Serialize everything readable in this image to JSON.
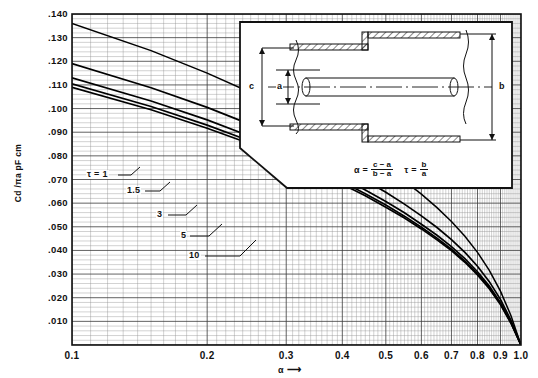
{
  "chart_data": {
    "type": "line",
    "title": "",
    "xlabel": "α",
    "ylabel": "Cd /πa pF cm",
    "xscale": "log",
    "yscale": "linear",
    "xlim": [
      0.1,
      1.0
    ],
    "ylim": [
      0.0,
      0.14
    ],
    "grid": true,
    "legend_position": "inline-labels",
    "xticks": [
      "0.1",
      "0.2",
      "0.3",
      "0.4",
      "0.5",
      "0.6",
      "0.7",
      "0.8",
      "0.9",
      "1.0"
    ],
    "xtick_values": [
      0.1,
      0.2,
      0.3,
      0.4,
      0.5,
      0.6,
      0.7,
      0.8,
      0.9,
      1.0
    ],
    "yticks": [
      ".010",
      ".020",
      ".030",
      ".040",
      ".050",
      ".060",
      ".070",
      ".080",
      ".090",
      ".100",
      ".110",
      ".120",
      ".130",
      ".140"
    ],
    "ytick_values": [
      0.01,
      0.02,
      0.03,
      0.04,
      0.05,
      0.06,
      0.07,
      0.08,
      0.09,
      0.1,
      0.11,
      0.12,
      0.13,
      0.14
    ],
    "series": [
      {
        "name": "τ = 1",
        "label": "τ = 1",
        "x": [
          0.1,
          0.15,
          0.2,
          0.25,
          0.3,
          0.35,
          0.4,
          0.45,
          0.5,
          0.55,
          0.6,
          0.65,
          0.7,
          0.75,
          0.8,
          0.85,
          0.9,
          0.95,
          1.0
        ],
        "values": [
          0.136,
          0.1245,
          0.115,
          0.1068,
          0.0995,
          0.0928,
          0.0866,
          0.0807,
          0.075,
          0.0694,
          0.0638,
          0.0581,
          0.0522,
          0.046,
          0.0392,
          0.0316,
          0.0228,
          0.0124,
          0.0
        ]
      },
      {
        "name": "τ = 1.5",
        "label": "1.5",
        "x": [
          0.1,
          0.15,
          0.2,
          0.25,
          0.3,
          0.35,
          0.4,
          0.45,
          0.5,
          0.55,
          0.6,
          0.65,
          0.7,
          0.75,
          0.8,
          0.85,
          0.9,
          0.95,
          1.0
        ],
        "values": [
          0.119,
          0.1088,
          0.1005,
          0.0932,
          0.0866,
          0.0806,
          0.075,
          0.0697,
          0.0646,
          0.0596,
          0.0546,
          0.0497,
          0.0446,
          0.0392,
          0.0333,
          0.0268,
          0.0193,
          0.0104,
          0.0
        ]
      },
      {
        "name": "τ = 3",
        "label": "3",
        "x": [
          0.1,
          0.15,
          0.2,
          0.25,
          0.3,
          0.35,
          0.4,
          0.45,
          0.5,
          0.55,
          0.6,
          0.65,
          0.7,
          0.75,
          0.8,
          0.85,
          0.9,
          0.95,
          1.0
        ],
        "values": [
          0.113,
          0.1032,
          0.0952,
          0.0882,
          0.0819,
          0.0761,
          0.0707,
          0.0656,
          0.0607,
          0.0559,
          0.0511,
          0.0464,
          0.0416,
          0.0365,
          0.031,
          0.0249,
          0.0179,
          0.0096,
          0.0
        ]
      },
      {
        "name": "τ = 5",
        "label": "5",
        "x": [
          0.1,
          0.15,
          0.2,
          0.25,
          0.3,
          0.35,
          0.4,
          0.45,
          0.5,
          0.55,
          0.6,
          0.65,
          0.7,
          0.75,
          0.8,
          0.85,
          0.9,
          0.95,
          1.0
        ],
        "values": [
          0.1105,
          0.1009,
          0.093,
          0.0862,
          0.08,
          0.0743,
          0.069,
          0.064,
          0.0592,
          0.0545,
          0.0498,
          0.0452,
          0.0405,
          0.0355,
          0.0301,
          0.0242,
          0.0174,
          0.0093,
          0.0
        ]
      },
      {
        "name": "τ = 10",
        "label": "10",
        "x": [
          0.1,
          0.15,
          0.2,
          0.25,
          0.3,
          0.35,
          0.4,
          0.45,
          0.5,
          0.55,
          0.6,
          0.65,
          0.7,
          0.75,
          0.8,
          0.85,
          0.9,
          0.95,
          1.0
        ],
        "values": [
          0.109,
          0.0995,
          0.0917,
          0.085,
          0.0789,
          0.0732,
          0.068,
          0.0631,
          0.0583,
          0.0537,
          0.0491,
          0.0445,
          0.0399,
          0.035,
          0.0296,
          0.0238,
          0.0171,
          0.0092,
          0.0
        ]
      }
    ],
    "annotations": [
      {
        "name": "tau-1-label",
        "text": "τ = 1"
      },
      {
        "name": "tau-1p5-label",
        "text": "1.5"
      },
      {
        "name": "tau-3-label",
        "text": "3"
      },
      {
        "name": "tau-5-label",
        "text": "5"
      },
      {
        "name": "tau-10-label",
        "text": "10"
      }
    ]
  },
  "axes": {
    "y_title": "Cd /πa pF cm",
    "x_title": "α",
    "x_title_arrow": "⟶"
  },
  "inset": {
    "name": "coaxial-step-cross-section",
    "dimensions": [
      {
        "key": "c",
        "label": "c"
      },
      {
        "key": "a",
        "label": "a"
      },
      {
        "key": "b",
        "label": "b"
      }
    ],
    "formula": {
      "alpha_symbol": "α",
      "equals": "=",
      "alpha_numerator": "c − a",
      "alpha_denominator": "b − a",
      "tau_symbol": "τ",
      "tau_equals": "=",
      "tau_numerator": "b",
      "tau_denominator": "a"
    }
  }
}
